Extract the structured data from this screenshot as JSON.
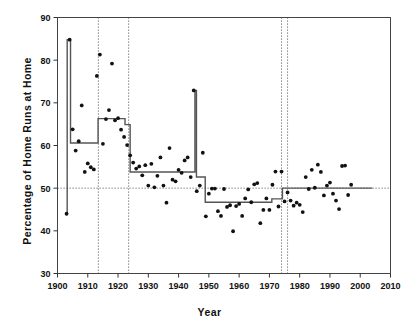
{
  "chart_data": {
    "type": "scatter",
    "title": "",
    "xlabel": "Year",
    "ylabel": "Percentage of Home Runs at Home",
    "xlim": [
      1900,
      2010
    ],
    "ylim": [
      30,
      90
    ],
    "xticks": [
      1900,
      1910,
      1920,
      1930,
      1940,
      1950,
      1960,
      1970,
      1980,
      1990,
      2000,
      2010
    ],
    "yticks": [
      30,
      40,
      50,
      60,
      70,
      80,
      90
    ],
    "grid": false,
    "legend": null,
    "reference_lines": {
      "horizontal": [
        50
      ],
      "vertical": [
        1913.5,
        1923.5,
        1974.0,
        1976.0
      ]
    },
    "series": [
      {
        "name": "Percentage of home runs hit at home",
        "marker": "filled-circle",
        "color": "#111111",
        "points": [
          [
            1903,
            44.0
          ],
          [
            1904,
            84.8
          ],
          [
            1905,
            63.8
          ],
          [
            1906,
            58.8
          ],
          [
            1907,
            61.0
          ],
          [
            1908,
            69.4
          ],
          [
            1909,
            53.8
          ],
          [
            1910,
            55.8
          ],
          [
            1911,
            54.9
          ],
          [
            1912,
            54.4
          ],
          [
            1913,
            76.3
          ],
          [
            1914,
            81.3
          ],
          [
            1915,
            60.4
          ],
          [
            1916,
            66.2
          ],
          [
            1917,
            68.3
          ],
          [
            1918,
            79.2
          ],
          [
            1919,
            65.9
          ],
          [
            1920,
            66.4
          ],
          [
            1921,
            63.7
          ],
          [
            1922,
            62.0
          ],
          [
            1923,
            60.1
          ],
          [
            1924,
            57.7
          ],
          [
            1925,
            56.0
          ],
          [
            1926,
            54.6
          ],
          [
            1927,
            55.1
          ],
          [
            1928,
            53.0
          ],
          [
            1929,
            55.4
          ],
          [
            1930,
            50.6
          ],
          [
            1931,
            55.7
          ],
          [
            1932,
            50.2
          ],
          [
            1933,
            52.9
          ],
          [
            1934,
            57.2
          ],
          [
            1935,
            50.6
          ],
          [
            1936,
            46.6
          ],
          [
            1937,
            59.4
          ],
          [
            1938,
            52.0
          ],
          [
            1939,
            51.6
          ],
          [
            1940,
            54.3
          ],
          [
            1941,
            53.6
          ],
          [
            1942,
            56.5
          ],
          [
            1943,
            57.2
          ],
          [
            1944,
            52.6
          ],
          [
            1945,
            72.9
          ],
          [
            1946,
            49.3
          ],
          [
            1947,
            50.6
          ],
          [
            1948,
            58.3
          ],
          [
            1949,
            43.4
          ],
          [
            1950,
            48.7
          ],
          [
            1951,
            49.9
          ],
          [
            1952,
            49.9
          ],
          [
            1953,
            44.6
          ],
          [
            1954,
            43.5
          ],
          [
            1955,
            49.8
          ],
          [
            1956,
            45.6
          ],
          [
            1957,
            46.0
          ],
          [
            1958,
            39.9
          ],
          [
            1959,
            45.8
          ],
          [
            1960,
            46.3
          ],
          [
            1961,
            43.5
          ],
          [
            1962,
            47.6
          ],
          [
            1963,
            49.7
          ],
          [
            1964,
            46.7
          ],
          [
            1965,
            50.9
          ],
          [
            1966,
            51.2
          ],
          [
            1967,
            41.8
          ],
          [
            1968,
            44.9
          ],
          [
            1969,
            47.6
          ],
          [
            1970,
            44.9
          ],
          [
            1971,
            50.8
          ],
          [
            1972,
            53.9
          ],
          [
            1973,
            45.7
          ],
          [
            1974,
            53.9
          ],
          [
            1975,
            46.9
          ],
          [
            1976,
            49.0
          ],
          [
            1977,
            47.1
          ],
          [
            1978,
            45.9
          ],
          [
            1979,
            46.6
          ],
          [
            1980,
            46.1
          ],
          [
            1981,
            44.4
          ],
          [
            1982,
            52.6
          ],
          [
            1983,
            49.8
          ],
          [
            1984,
            54.3
          ],
          [
            1985,
            50.1
          ],
          [
            1986,
            55.5
          ],
          [
            1987,
            53.8
          ],
          [
            1988,
            48.3
          ],
          [
            1989,
            50.6
          ],
          [
            1990,
            51.3
          ],
          [
            1991,
            48.7
          ],
          [
            1992,
            47.1
          ],
          [
            1993,
            45.1
          ],
          [
            1994,
            55.2
          ],
          [
            1995,
            55.3
          ],
          [
            1996,
            48.4
          ],
          [
            1997,
            50.8
          ]
        ]
      }
    ],
    "step_fit": {
      "name": "Fitted step function (changepoint model)",
      "color": "#555555",
      "segments": [
        {
          "x_start": 1903.0,
          "x_end": 1903.2,
          "value": 44.0
        },
        {
          "x_start": 1903.2,
          "x_end": 1904.3,
          "value": 84.8
        },
        {
          "x_start": 1904.3,
          "x_end": 1913.4,
          "value": 60.6
        },
        {
          "x_start": 1913.4,
          "x_end": 1922.3,
          "value": 66.3
        },
        {
          "x_start": 1922.3,
          "x_end": 1924.0,
          "value": 64.9
        },
        {
          "x_start": 1924.0,
          "x_end": 1945.4,
          "value": 53.8
        },
        {
          "x_start": 1945.4,
          "x_end": 1945.9,
          "value": 72.9
        },
        {
          "x_start": 1945.9,
          "x_end": 1948.8,
          "value": 52.6
        },
        {
          "x_start": 1948.8,
          "x_end": 1970.8,
          "value": 46.7
        },
        {
          "x_start": 1970.8,
          "x_end": 1974.3,
          "value": 47.5
        },
        {
          "x_start": 1974.3,
          "x_end": 2004.0,
          "value": 50.0
        }
      ]
    }
  }
}
